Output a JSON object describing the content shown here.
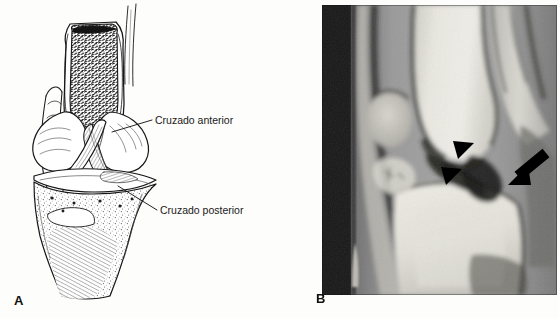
{
  "figure": {
    "type": "two-panel medical figure",
    "background_color": "#fdfdfb"
  },
  "panel_a": {
    "letter": "A",
    "kind": "line-art anatomical illustration",
    "description": "Anterior view of the knee joint with the femur sectioned to expose trabecular bone, showing the crossing cruciate ligaments and the tibial plateau",
    "ink_color": "#1a1a1a",
    "callouts": [
      {
        "label": "Cruzado anterior",
        "name": "anterior-cruciate-label"
      },
      {
        "label": "Cruzado posterior",
        "name": "posterior-cruciate-label"
      }
    ]
  },
  "panel_b": {
    "letter": "B",
    "kind": "sagittal MRI of the knee",
    "markers": [
      {
        "name": "arrowhead-upper",
        "glyph": "arrowhead",
        "color": "#000000"
      },
      {
        "name": "arrowhead-lower",
        "glyph": "arrowhead",
        "color": "#000000"
      },
      {
        "name": "thick-arrow",
        "glyph": "arrow",
        "color": "#000000"
      }
    ],
    "colors": {
      "film_border": "#141414",
      "bone_bright": "#e8e6e0",
      "soft_tissue": "#8d8d8d",
      "dark_band": "#1d1d1d"
    }
  }
}
